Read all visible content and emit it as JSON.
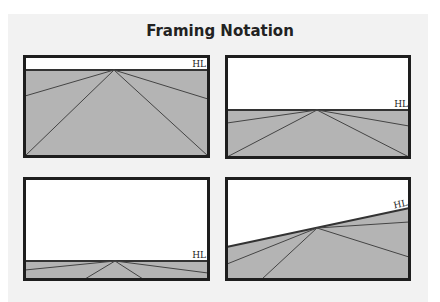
{
  "title": "Framing Notation",
  "colors": {
    "sky": "#ffffff",
    "ground": "#b4b4b4",
    "line": "#333333",
    "border": "#1e1e1e",
    "background": "#f2f2f2"
  },
  "frames": [
    {
      "name": "high-horizon",
      "label": "HL"
    },
    {
      "name": "middle-horizon",
      "label": "HL"
    },
    {
      "name": "low-horizon",
      "label": "HL"
    },
    {
      "name": "tilted-horizon",
      "label": "HL"
    }
  ]
}
